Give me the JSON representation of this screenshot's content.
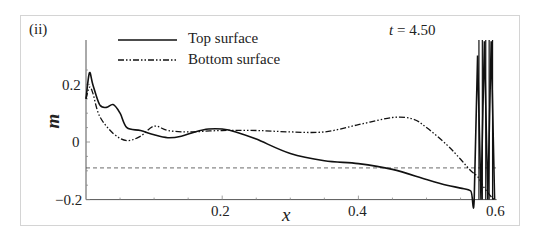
{
  "chart_data": {
    "type": "line",
    "panel_label": "(ii)",
    "annotation": "t = 4.50",
    "annotation_var": "t",
    "annotation_value": "= 4.50",
    "xlabel": "x",
    "ylabel": "m",
    "xlim": [
      0,
      0.6
    ],
    "ylim": [
      -0.2,
      0.3
    ],
    "xticks": [
      "0.2",
      "0.4",
      "0.6"
    ],
    "yticks": [
      "0.2",
      "0",
      "−0.2"
    ],
    "grid": false,
    "legend_position": "upper left",
    "legend": [
      {
        "name": "Top surface",
        "style": "solid"
      },
      {
        "name": "Bottom surface",
        "style": "dash-dot-dot"
      }
    ],
    "reference_line": {
      "y": -0.09,
      "style": "dashed"
    },
    "series": [
      {
        "name": "Top surface",
        "style": "solid",
        "x": [
          0.0,
          0.005,
          0.01,
          0.02,
          0.03,
          0.04,
          0.05,
          0.06,
          0.08,
          0.1,
          0.12,
          0.14,
          0.16,
          0.18,
          0.2,
          0.22,
          0.25,
          0.3,
          0.35,
          0.4,
          0.45,
          0.5,
          0.53,
          0.55,
          0.565,
          0.57,
          0.575,
          0.58,
          0.585,
          0.59,
          0.595,
          0.6
        ],
        "values": [
          0.15,
          0.24,
          0.2,
          0.13,
          0.12,
          0.13,
          0.1,
          0.05,
          0.04,
          0.025,
          0.015,
          0.02,
          0.035,
          0.045,
          0.045,
          0.035,
          0.01,
          -0.04,
          -0.065,
          -0.075,
          -0.095,
          -0.13,
          -0.15,
          -0.16,
          -0.17,
          -0.2,
          0.3,
          -0.2,
          0.35,
          -0.2,
          0.35,
          -0.2
        ]
      },
      {
        "name": "Bottom surface",
        "style": "dash-dot-dot",
        "x": [
          0.0,
          0.005,
          0.01,
          0.02,
          0.04,
          0.06,
          0.08,
          0.1,
          0.12,
          0.15,
          0.2,
          0.25,
          0.3,
          0.35,
          0.4,
          0.45,
          0.48,
          0.5,
          0.53,
          0.55,
          0.565,
          0.575,
          0.585,
          0.595,
          0.6
        ],
        "values": [
          0.15,
          0.19,
          0.17,
          0.09,
          0.03,
          0.005,
          0.02,
          0.055,
          0.04,
          0.035,
          0.04,
          0.04,
          0.035,
          0.035,
          0.06,
          0.085,
          0.08,
          0.05,
          -0.01,
          -0.06,
          -0.1,
          -0.12,
          -0.16,
          -0.19,
          -0.2
        ]
      }
    ]
  }
}
